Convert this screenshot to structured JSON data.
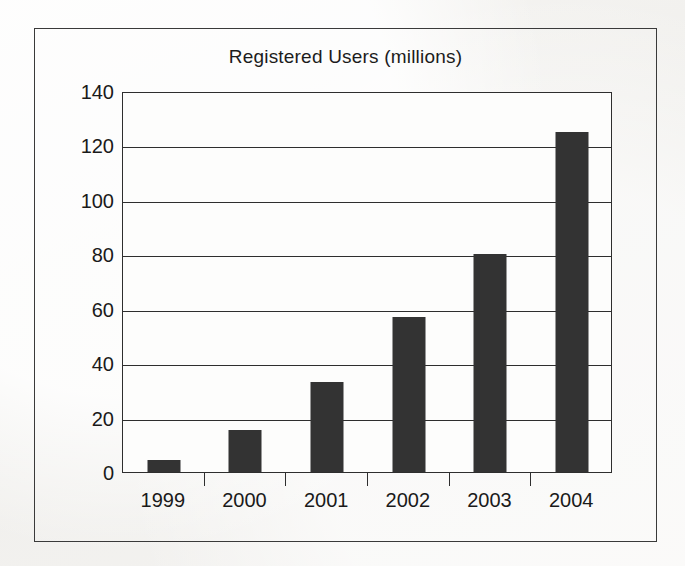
{
  "chart_data": {
    "type": "bar",
    "title": "Registered Users (millions)",
    "xlabel": "",
    "ylabel": "",
    "categories": [
      "1999",
      "2000",
      "2001",
      "2002",
      "2003",
      "2004"
    ],
    "values": [
      4.5,
      15.5,
      33,
      57,
      80,
      125
    ],
    "series": [
      {
        "name": "Registered Users (millions)",
        "values": [
          4.5,
          15.5,
          33,
          57,
          80,
          125
        ]
      }
    ],
    "ylim": [
      0,
      140
    ],
    "ytick_labels": [
      "0",
      "20",
      "40",
      "60",
      "80",
      "100",
      "120",
      "140"
    ],
    "ytick_values": [
      0,
      20,
      40,
      60,
      80,
      100,
      120,
      140
    ],
    "grid": "horizontal",
    "legend": "none",
    "bar_color": "#333333",
    "axis_color": "#2e2e2e",
    "plot_background": "#fdfdfc",
    "page_background": "#f3f2f0"
  }
}
